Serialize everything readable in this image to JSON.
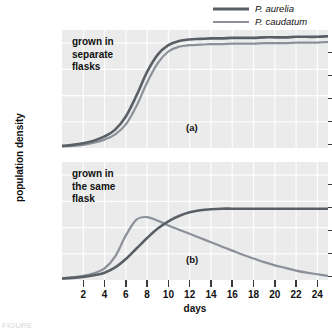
{
  "figure": {
    "y_axis_title": "population density",
    "x_axis_title": "days",
    "caption_clipped": "FIGURE"
  },
  "legend": {
    "position": "top-right",
    "entries": [
      {
        "label": "P. aurelia",
        "color": "#5a5f66",
        "icon": "line-swatch-icon"
      },
      {
        "label": "P. caudatum",
        "color": "#8b9099",
        "icon": "line-swatch-icon"
      }
    ]
  },
  "panels": [
    {
      "tag": "(a)",
      "note": "grown in\nseparate\nflasks"
    },
    {
      "tag": "(b)",
      "note": "grown in\nthe same\nflask"
    }
  ],
  "yticks": [
    "200",
    "150",
    "100",
    "50",
    "0"
  ],
  "xticks": [
    "2",
    "4",
    "6",
    "8",
    "10",
    "12",
    "14",
    "16",
    "18",
    "20",
    "22",
    "24"
  ],
  "chart_data": [
    {
      "type": "line",
      "title": "(a) grown in separate flasks",
      "xlabel": "days",
      "ylabel": "population density",
      "xlim": [
        0,
        25
      ],
      "ylim": [
        0,
        225
      ],
      "grid": true,
      "legend_position": "top-right",
      "x": [
        0,
        1,
        2,
        3,
        4,
        5,
        6,
        7,
        8,
        9,
        10,
        11,
        12,
        13,
        14,
        15,
        16,
        17,
        18,
        19,
        20,
        21,
        22,
        23,
        24,
        25
      ],
      "series": [
        {
          "name": "P. aurelia",
          "color": "#5a5f66",
          "values": [
            4,
            6,
            9,
            14,
            22,
            35,
            60,
            100,
            145,
            178,
            196,
            204,
            207,
            208,
            209,
            209,
            210,
            210,
            210,
            211,
            211,
            211,
            212,
            212,
            212,
            213
          ]
        },
        {
          "name": "P. caudatum",
          "color": "#8b9099",
          "values": [
            3,
            4,
            6,
            10,
            16,
            26,
            45,
            80,
            125,
            162,
            184,
            193,
            196,
            197,
            198,
            198,
            199,
            199,
            199,
            200,
            200,
            200,
            201,
            201,
            201,
            202
          ]
        }
      ]
    },
    {
      "type": "line",
      "title": "(b) grown in the same flask",
      "xlabel": "days",
      "ylabel": "population density",
      "xlim": [
        0,
        25
      ],
      "ylim": [
        0,
        225
      ],
      "grid": true,
      "legend_position": "top-right",
      "x": [
        0,
        1,
        2,
        3,
        4,
        5,
        6,
        7,
        8,
        9,
        10,
        11,
        12,
        13,
        14,
        15,
        16,
        17,
        18,
        19,
        20,
        21,
        22,
        23,
        24,
        25
      ],
      "series": [
        {
          "name": "P. aurelia",
          "color": "#5a5f66",
          "values": [
            3,
            4,
            6,
            9,
            14,
            24,
            40,
            60,
            80,
            98,
            112,
            122,
            129,
            133,
            135,
            136,
            136,
            136,
            136,
            136,
            136,
            136,
            136,
            136,
            136,
            136
          ]
        },
        {
          "name": "P. caudatum",
          "color": "#8b9099",
          "values": [
            3,
            5,
            8,
            13,
            22,
            45,
            85,
            115,
            120,
            113,
            104,
            96,
            88,
            80,
            72,
            64,
            56,
            48,
            41,
            34,
            28,
            23,
            18,
            14,
            11,
            8
          ]
        }
      ]
    }
  ]
}
